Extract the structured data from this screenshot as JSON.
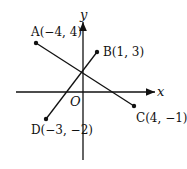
{
  "diagram": {
    "axes": {
      "x_label": "x",
      "y_label": "y",
      "origin_label": "O"
    },
    "points": [
      {
        "id": "A",
        "label": "A(−4, 4)",
        "x": -4,
        "y": 4
      },
      {
        "id": "B",
        "label": "B(1, 3)",
        "x": 1,
        "y": 3
      },
      {
        "id": "C",
        "label": "C(4, −1)",
        "x": 4,
        "y": -1
      },
      {
        "id": "D",
        "label": "D(−3, −2)",
        "x": -3,
        "y": -2
      }
    ],
    "segments": [
      {
        "from": "A",
        "to": "C"
      },
      {
        "from": "D",
        "to": "B"
      }
    ]
  }
}
